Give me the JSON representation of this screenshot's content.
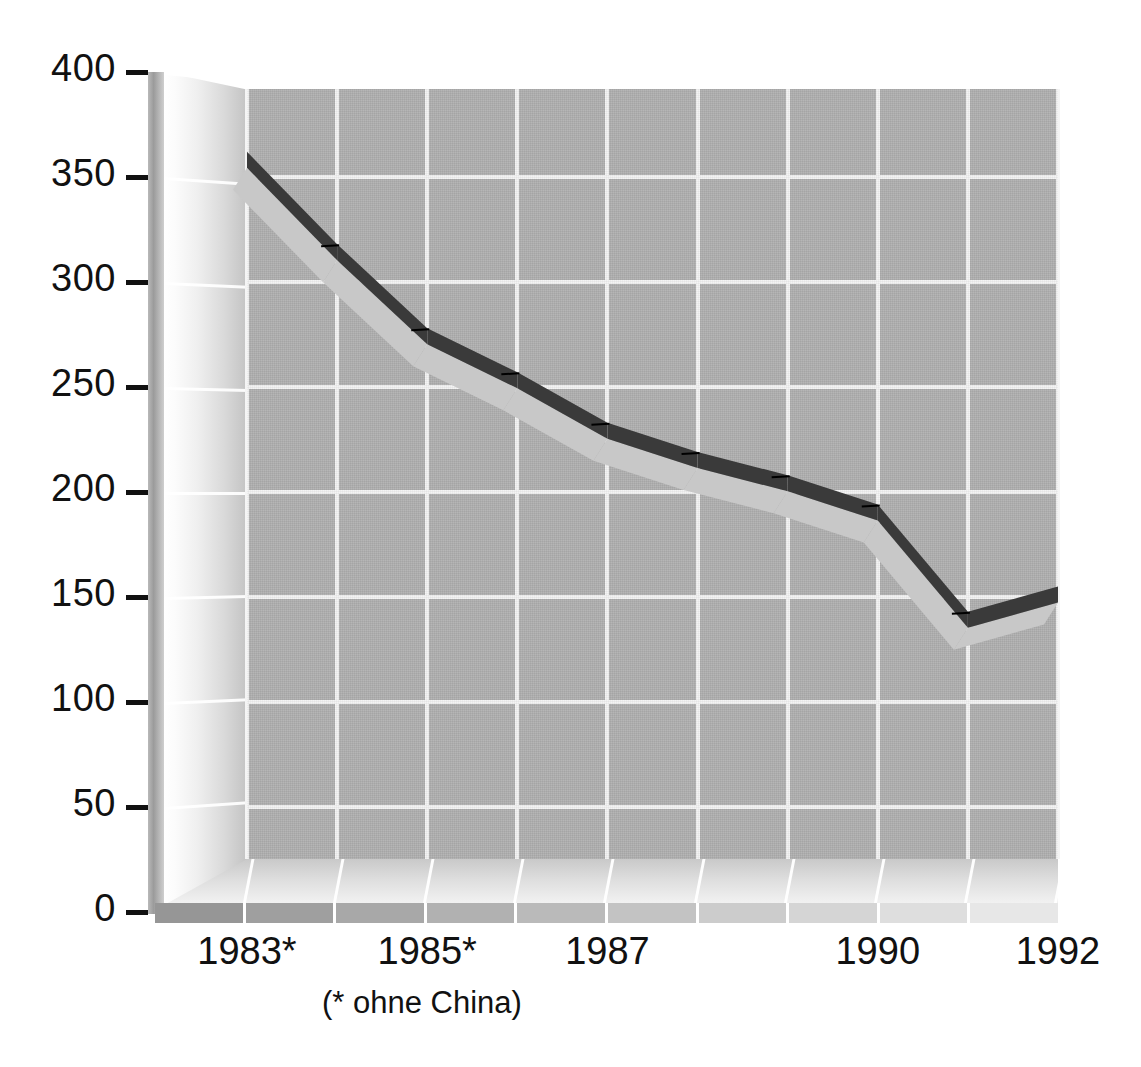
{
  "chart_data": {
    "type": "line",
    "title": "",
    "subtitle": "",
    "xlabel": "",
    "ylabel": "",
    "footnote": "(* ohne China)",
    "grid": true,
    "legend": "none",
    "style": "3d-ribbon-line",
    "ylim": [
      0,
      400
    ],
    "yticks": [
      0,
      50,
      100,
      150,
      200,
      250,
      300,
      350,
      400
    ],
    "ytick_labels": [
      "0",
      "50",
      "100",
      "150",
      "200",
      "250",
      "300",
      "350",
      "400"
    ],
    "categories": [
      "1983*",
      "1984",
      "1985*",
      "1986",
      "1987",
      "1988",
      "1989",
      "1990",
      "1991",
      "1992"
    ],
    "xtick_labels_shown": [
      "1983*",
      "1985*",
      "1987",
      "1990",
      "1992"
    ],
    "values": [
      362,
      318,
      278,
      257,
      233,
      219,
      208,
      194,
      143,
      155
    ],
    "series": [
      {
        "name": "Reihe 1",
        "values": [
          362,
          318,
          278,
          257,
          233,
          219,
          208,
          194,
          143,
          155
        ]
      }
    ]
  },
  "axes": {
    "y": {
      "ticks": [
        {
          "label": "400",
          "value": 400
        },
        {
          "label": "350",
          "value": 350
        },
        {
          "label": "300",
          "value": 300
        },
        {
          "label": "250",
          "value": 250
        },
        {
          "label": "200",
          "value": 200
        },
        {
          "label": "150",
          "value": 150
        },
        {
          "label": "100",
          "value": 100
        },
        {
          "label": "50",
          "value": 50
        },
        {
          "label": "0",
          "value": 0
        }
      ]
    },
    "x": {
      "ticks": [
        {
          "label": "1983*",
          "index": 0
        },
        {
          "label": "1985*",
          "index": 2
        },
        {
          "label": "1987",
          "index": 4
        },
        {
          "label": "1990",
          "index": 7
        },
        {
          "label": "1992",
          "index": 9
        }
      ]
    }
  },
  "annotations": {
    "footnote": "(* ohne China)"
  },
  "colors": {
    "plot_background": "#b0b0b0",
    "gridline": "#f4f4f4",
    "ribbon_top": "#3a3a3a",
    "ribbon_side": "#c8c8c8",
    "axis_text": "#111111",
    "page_background": "#ffffff"
  }
}
